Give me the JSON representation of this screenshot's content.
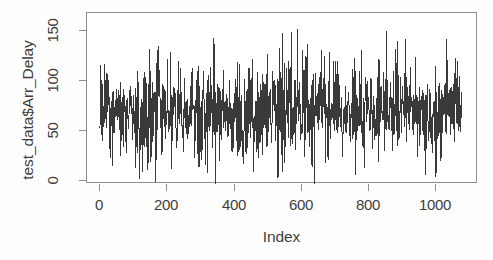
{
  "chart_data": {
    "type": "line",
    "title": "",
    "subtitle": "",
    "xlabel": "Index",
    "ylabel": "test_data$Arr_Delay",
    "xlim": [
      -20,
      1100
    ],
    "ylim": [
      -8,
      168
    ],
    "xticks": [
      0,
      200,
      400,
      600,
      800,
      1000
    ],
    "xtick_labels": [
      "0",
      "200",
      "400",
      "600",
      "800",
      "1000"
    ],
    "yticks": [
      0,
      50,
      100,
      150
    ],
    "ytick_labels": [
      "0",
      "50",
      "100",
      "150"
    ],
    "grid": false,
    "legend": null,
    "legend_position": "none",
    "annotations": [],
    "series_color": "#3a3a3a",
    "line_width": 1,
    "n_points": 1080,
    "series_name": "test_data$Arr_Delay",
    "stats": {
      "mean": 68,
      "median": 67,
      "min": -6,
      "max": 162,
      "sd": 23
    },
    "x": [
      0,
      200,
      400,
      600,
      800,
      1000,
      1080
    ],
    "values": [
      68,
      67,
      69,
      68,
      70,
      69,
      70
    ],
    "series": [
      {
        "name": "Arr_Delay",
        "envelope_upper": [
          134,
          128,
          143,
          130,
          126,
          150,
          121,
          135,
          147,
          158,
          162,
          133,
          126,
          139,
          157,
          145,
          129,
          146
        ],
        "envelope_lower": [
          8,
          2,
          -5,
          6,
          1,
          -2,
          12,
          0,
          4,
          -1,
          -6,
          9,
          3,
          -4,
          2,
          7,
          -3,
          11
        ],
        "band_upper": [
          100,
          98,
          104,
          99,
          97,
          108,
          96,
          101,
          106,
          110,
          112,
          99,
          97,
          103,
          109,
          105,
          98,
          104
        ],
        "band_lower": [
          38,
          35,
          32,
          37,
          36,
          30,
          41,
          34,
          33,
          31,
          29,
          39,
          36,
          33,
          34,
          38,
          32,
          40
        ]
      }
    ]
  },
  "axes": {
    "y_tick_pixels": [
      180,
      130,
      80,
      30
    ],
    "x_tick_pixels": [
      99,
      166,
      234,
      301,
      368,
      435
    ],
    "frame": {
      "left": 86,
      "top": 12,
      "width": 391,
      "height": 171
    }
  },
  "colors": {
    "background": "#ffffff",
    "frame": "#8e8e8e",
    "text": "#3d3d3d",
    "series": "#3a3a3a"
  }
}
